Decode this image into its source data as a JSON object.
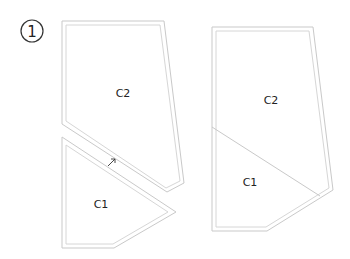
{
  "step_number": "1",
  "left_figure": {
    "upper_piece_label": "C2",
    "lower_piece_label": "C1",
    "arrow_icon": "arrow-up-right-icon"
  },
  "right_figure": {
    "upper_region_label": "C2",
    "lower_region_label": "C1"
  },
  "colors": {
    "outline": "#c9c9c9",
    "text": "#222222"
  }
}
